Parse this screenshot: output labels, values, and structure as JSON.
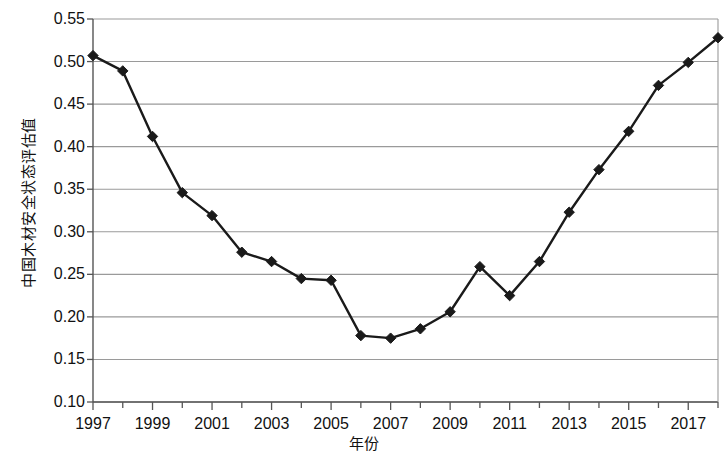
{
  "chart_data": {
    "type": "line",
    "title": "",
    "subtitle": "",
    "xlabel": "年份",
    "ylabel": "中国木材安全状态评估值",
    "x": [
      1997,
      1998,
      1999,
      2000,
      2001,
      2002,
      2003,
      2004,
      2005,
      2006,
      2007,
      2008,
      2009,
      2010,
      2011,
      2012,
      2013,
      2014,
      2015,
      2016,
      2017,
      2018
    ],
    "values": [
      0.507,
      0.489,
      0.412,
      0.346,
      0.319,
      0.276,
      0.265,
      0.245,
      0.243,
      0.178,
      0.175,
      0.186,
      0.206,
      0.259,
      0.225,
      0.265,
      0.323,
      0.373,
      0.418,
      0.472,
      0.499,
      0.528
    ],
    "series": [
      {
        "name": "中国木材安全状态评估值",
        "values": [
          0.507,
          0.489,
          0.412,
          0.346,
          0.319,
          0.276,
          0.265,
          0.245,
          0.243,
          0.178,
          0.175,
          0.186,
          0.206,
          0.259,
          0.225,
          0.265,
          0.323,
          0.373,
          0.418,
          0.472,
          0.499,
          0.528
        ]
      }
    ],
    "ylim": [
      0.1,
      0.55
    ],
    "xlim": [
      1997,
      2018
    ],
    "ytick_labels": [
      "0.10",
      "0.15",
      "0.20",
      "0.25",
      "0.30",
      "0.35",
      "0.40",
      "0.45",
      "0.50",
      "0.55"
    ],
    "ytick_values": [
      0.1,
      0.15,
      0.2,
      0.25,
      0.3,
      0.35,
      0.4,
      0.45,
      0.5,
      0.55
    ],
    "xtick_labels": [
      "1997",
      "1999",
      "2001",
      "2003",
      "2005",
      "2007",
      "2009",
      "2011",
      "2013",
      "2015",
      "2017"
    ],
    "xtick_values": [
      1997,
      1999,
      2001,
      2003,
      2005,
      2007,
      2009,
      2011,
      2013,
      2015,
      2017
    ],
    "minor_xticks": [
      1998,
      2000,
      2002,
      2004,
      2006,
      2008,
      2010,
      2012,
      2014,
      2016,
      2018
    ],
    "grid": "horizontal",
    "legend": "none",
    "line_color": "#1a1a1a",
    "marker": "diamond",
    "marker_color": "#1a1a1a",
    "grid_color": "#9a9a9a",
    "axis_color": "#555555",
    "background": "#ffffff"
  }
}
